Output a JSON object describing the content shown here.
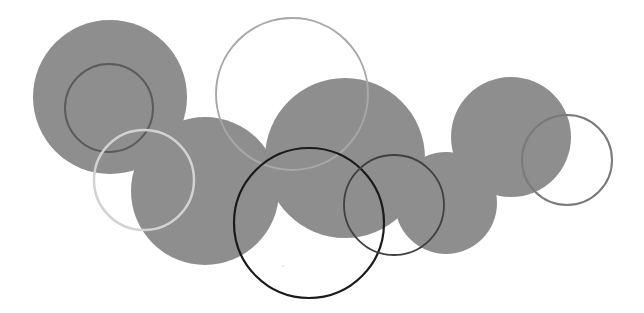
{
  "canvas": {
    "width": 644,
    "height": 313,
    "background": "#ffffff"
  },
  "filled_circles": [
    {
      "name": "filled-circle-left",
      "cx": 110,
      "cy": 97,
      "r": 77,
      "fill": "#8e8e8e"
    },
    {
      "name": "filled-circle-left-lower",
      "cx": 205,
      "cy": 191,
      "r": 74,
      "fill": "#8e8e8e"
    },
    {
      "name": "filled-circle-center",
      "cx": 345,
      "cy": 158,
      "r": 80,
      "fill": "#8e8e8e"
    },
    {
      "name": "filled-circle-center-right",
      "cx": 446,
      "cy": 203,
      "r": 51,
      "fill": "#8e8e8e"
    },
    {
      "name": "filled-circle-right",
      "cx": 511,
      "cy": 137,
      "r": 60,
      "fill": "#8e8e8e"
    }
  ],
  "outline_circles": [
    {
      "name": "ring-dark-left",
      "cx": 109,
      "cy": 108,
      "r": 44,
      "stroke": "#5c5c5c",
      "width": 2
    },
    {
      "name": "ring-light-left",
      "cx": 144,
      "cy": 180,
      "r": 50,
      "stroke": "#d2d2d2",
      "width": 2.5
    },
    {
      "name": "ring-large-top",
      "cx": 292,
      "cy": 94,
      "r": 76,
      "stroke": "#a8a8a8",
      "width": 2
    },
    {
      "name": "ring-black-bottom",
      "cx": 309,
      "cy": 223,
      "r": 75,
      "stroke": "#1a1a1a",
      "width": 2.2
    },
    {
      "name": "ring-dark-center-right",
      "cx": 394,
      "cy": 205,
      "r": 50,
      "stroke": "#404040",
      "width": 1.8
    },
    {
      "name": "ring-gray-right",
      "cx": 567,
      "cy": 160,
      "r": 45,
      "stroke": "#7a7a7a",
      "width": 2
    }
  ]
}
